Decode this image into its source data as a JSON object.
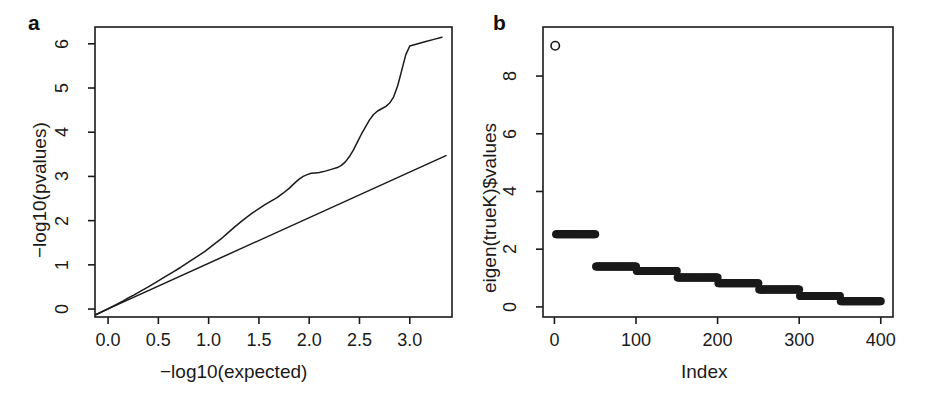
{
  "figure": {
    "width": 929,
    "height": 404,
    "background": "#ffffff",
    "ink": "#1a1a1a"
  },
  "panels": [
    {
      "tag": "a",
      "tag_x": 28,
      "tag_y": 12,
      "chart_data": {
        "type": "line",
        "title": "",
        "xlabel": "−log10(expected)",
        "ylabel": "−log10(pvalues)",
        "xlim": [
          -0.13,
          3.42
        ],
        "ylim": [
          -0.18,
          6.38
        ],
        "grid": false,
        "legend": "none",
        "xticks": [
          0.0,
          0.5,
          1.0,
          1.5,
          2.0,
          2.5,
          3.0
        ],
        "xticklabels": [
          "0.0",
          "0.5",
          "1.0",
          "1.5",
          "2.0",
          "2.5",
          "3.0"
        ],
        "yticks": [
          0,
          1,
          2,
          3,
          4,
          5,
          6
        ],
        "yticklabels": [
          "0",
          "1",
          "2",
          "3",
          "4",
          "5",
          "6"
        ],
        "series": [
          {
            "name": "qq-curve",
            "style": "line",
            "x": [
              -0.12,
              -0.05,
              0.02,
              0.08,
              0.14,
              0.2,
              0.26,
              0.32,
              0.4,
              0.48,
              0.56,
              0.64,
              0.72,
              0.8,
              0.88,
              0.96,
              1.04,
              1.12,
              1.2,
              1.26,
              1.32,
              1.38,
              1.44,
              1.5,
              1.56,
              1.62,
              1.68,
              1.74,
              1.8,
              1.86,
              1.9,
              1.94,
              1.98,
              2.02,
              2.06,
              2.1,
              2.16,
              2.22,
              2.28,
              2.32,
              2.36,
              2.4,
              2.44,
              2.48,
              2.52,
              2.56,
              2.6,
              2.64,
              2.68,
              2.72,
              2.76,
              2.8,
              2.84,
              2.88,
              2.92,
              2.96,
              3.0,
              3.08,
              3.16,
              3.24,
              3.32
            ],
            "y": [
              -0.13,
              -0.05,
              0.03,
              0.1,
              0.17,
              0.25,
              0.32,
              0.4,
              0.5,
              0.61,
              0.72,
              0.83,
              0.94,
              1.06,
              1.18,
              1.3,
              1.44,
              1.58,
              1.74,
              1.86,
              1.97,
              2.08,
              2.18,
              2.27,
              2.36,
              2.44,
              2.52,
              2.62,
              2.73,
              2.86,
              2.94,
              3.0,
              3.04,
              3.07,
              3.08,
              3.09,
              3.12,
              3.16,
              3.2,
              3.25,
              3.33,
              3.45,
              3.6,
              3.78,
              3.96,
              4.12,
              4.28,
              4.4,
              4.48,
              4.53,
              4.58,
              4.66,
              4.8,
              5.05,
              5.4,
              5.75,
              5.95,
              6.0,
              6.05,
              6.1,
              6.15
            ]
          },
          {
            "name": "identity-line",
            "style": "line",
            "x": [
              -0.12,
              3.36
            ],
            "y": [
              -0.12,
              3.47
            ]
          }
        ]
      }
    },
    {
      "tag": "b",
      "tag_x": 28,
      "tag_y": 12,
      "chart_data": {
        "type": "scatter",
        "title": "",
        "xlabel": "Index",
        "ylabel": "eigen(trueK)$values",
        "xlim": [
          -14,
          415
        ],
        "ylim": [
          -0.35,
          9.7
        ],
        "grid": false,
        "legend": "none",
        "xticks": [
          0,
          100,
          200,
          300,
          400
        ],
        "xticklabels": [
          "0",
          "100",
          "200",
          "300",
          "400"
        ],
        "yticks": [
          0,
          2,
          4,
          6,
          8
        ],
        "yticklabels": [
          "0",
          "2",
          "4",
          "6",
          "8"
        ],
        "series": [
          {
            "name": "leading-eigenvalue",
            "style": "open-circle",
            "x": [
              1
            ],
            "y": [
              9.05
            ]
          },
          {
            "name": "eigenvalue-plateaus",
            "style": "filled-dots",
            "note": "index ranges each holding a near-constant eigenvalue",
            "steps": [
              {
                "x_start": 2,
                "x_end": 50,
                "value": 2.52
              },
              {
                "x_start": 51,
                "x_end": 100,
                "value": 1.4
              },
              {
                "x_start": 101,
                "x_end": 150,
                "value": 1.24
              },
              {
                "x_start": 151,
                "x_end": 200,
                "value": 1.02
              },
              {
                "x_start": 201,
                "x_end": 250,
                "value": 0.82
              },
              {
                "x_start": 251,
                "x_end": 300,
                "value": 0.6
              },
              {
                "x_start": 301,
                "x_end": 350,
                "value": 0.38
              },
              {
                "x_start": 351,
                "x_end": 400,
                "value": 0.2
              }
            ]
          }
        ]
      }
    }
  ]
}
